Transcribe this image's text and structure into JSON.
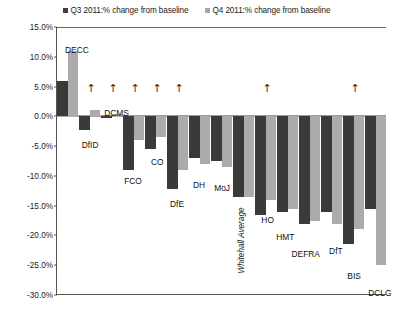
{
  "legend": {
    "q3_label": "Q3 2011:% change from baseline",
    "q4_label": "Q4 2011:% change from baseline",
    "q3_color": "#3a3a3a",
    "q4_color": "#ababab",
    "position": "top-center"
  },
  "axis": {
    "yticks": [
      "15.0%",
      "10.0%",
      "5.0%",
      "0.0%",
      "-5.0%",
      "-10.0%",
      "-15.0%",
      "-20.0%",
      "-25.0%",
      "-30.0%"
    ],
    "ymax": 15.0,
    "ymin": -30.0,
    "ystep": 5.0,
    "grid": false
  },
  "chart_data": {
    "type": "bar",
    "title": "",
    "xlabel": "",
    "ylabel": "",
    "ylim": [
      -30.0,
      15.0
    ],
    "categories": [
      "DECC",
      "DfID",
      "DCMS",
      "FCO",
      "CO",
      "DfE",
      "DH",
      "MoJ",
      "Whitehall Average",
      "HO",
      "HMT",
      "DEFRA",
      "DfT",
      "BIS",
      "DCLG"
    ],
    "series": [
      {
        "name": "Q3 2011:% change from baseline",
        "color": "#3a3a3a",
        "values": [
          6.0,
          -2.3,
          -0.2,
          -9.0,
          -5.5,
          -12.2,
          -7.0,
          -7.5,
          -13.5,
          -16.5,
          -16.0,
          -18.0,
          -16.0,
          -21.5,
          -15.5
        ]
      },
      {
        "name": "Q4 2011:% change from baseline",
        "color": "#ababab",
        "values": [
          11.0,
          1.0,
          0.4,
          -4.0,
          -3.5,
          -9.0,
          -8.0,
          -8.5,
          -13.5,
          -14.0,
          -15.5,
          -17.5,
          -18.0,
          -19.0,
          -25.0
        ]
      }
    ],
    "annotations": [
      {
        "glyph": "↑",
        "category": "DfID"
      },
      {
        "glyph": "↑",
        "category": "DCMS"
      },
      {
        "glyph": "↑",
        "category": "FCO"
      },
      {
        "glyph": "↑",
        "category": "CO"
      },
      {
        "glyph": "↑",
        "category": "DfE"
      },
      {
        "glyph": "↑",
        "category": "HO"
      },
      {
        "glyph": "↑",
        "category": "BIS"
      }
    ]
  },
  "labels": {
    "DECC": "DECC",
    "DfID": "DfID",
    "DCMS": "DCMS",
    "FCO": "FCO",
    "CO": "CO",
    "DfE": "DfE",
    "DH": "DH",
    "MoJ": "MoJ",
    "WhitehallAverage": "Whitehall Average",
    "HO": "HO",
    "HMT": "HMT",
    "DEFRA": "DEFRA",
    "DfT": "DfT",
    "BIS": "BIS",
    "DCLG": "DCLG"
  }
}
